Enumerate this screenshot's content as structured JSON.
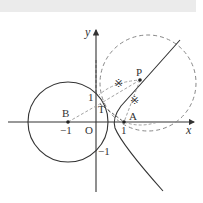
{
  "diagram": {
    "axes": {
      "x_label": "x",
      "y_label": "y",
      "origin_label": "O"
    },
    "ticks": {
      "x_neg1": "−1",
      "x_pos1": "1",
      "y_pos1": "1",
      "y_neg1": "−1"
    },
    "points": {
      "A": "A",
      "B": "B",
      "P": "P",
      "T": "T"
    },
    "tick_marks": {
      "mark1": "※",
      "mark2": "※"
    },
    "colors": {
      "solid": "#333333",
      "dashed": "#999999",
      "topbar": "#ebebeb"
    }
  }
}
